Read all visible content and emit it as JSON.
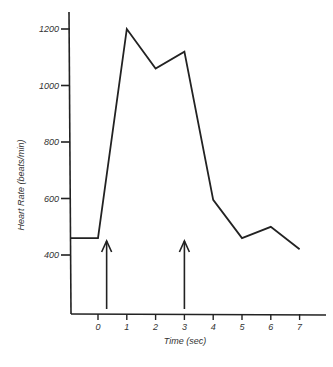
{
  "chart_data": {
    "type": "line",
    "title": "",
    "xlabel": "Time (sec)",
    "ylabel": "Heart Rate (beats/min)",
    "x_ticks": [
      "0",
      "1",
      "2",
      "3",
      "4",
      "5",
      "6",
      "7"
    ],
    "y_ticks": [
      "400",
      "600",
      "800",
      "1000",
      "1200"
    ],
    "xlim": [
      -1,
      8
    ],
    "ylim": [
      200,
      1300
    ],
    "grid": false,
    "legend": null,
    "series": [
      {
        "name": "Heart Rate",
        "x": [
          -0.8,
          0,
          1,
          2,
          3,
          4,
          5,
          6,
          7
        ],
        "y": [
          460,
          460,
          1200,
          1060,
          1120,
          595,
          460,
          500,
          420
        ]
      }
    ],
    "annotations": [
      {
        "type": "arrow",
        "x": 0.3,
        "direction": "up"
      },
      {
        "type": "arrow",
        "x": 3,
        "direction": "up"
      }
    ]
  }
}
